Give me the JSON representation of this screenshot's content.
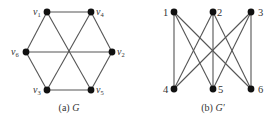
{
  "figure": {
    "graph_a": {
      "caption_prefix": "(a) ",
      "caption_name": "G",
      "nodes": [
        {
          "id": "v1",
          "letter": "v",
          "sub": "1",
          "x": 47,
          "y": 12,
          "lx": 33,
          "ly": 15
        },
        {
          "id": "v4",
          "letter": "v",
          "sub": "4",
          "x": 91,
          "y": 12,
          "lx": 96,
          "ly": 15
        },
        {
          "id": "v6",
          "letter": "v",
          "sub": "6",
          "x": 26,
          "y": 52,
          "lx": 11,
          "ly": 55
        },
        {
          "id": "v2",
          "letter": "v",
          "sub": "2",
          "x": 112,
          "y": 52,
          "lx": 117,
          "ly": 55
        },
        {
          "id": "v3",
          "letter": "v",
          "sub": "3",
          "x": 47,
          "y": 90,
          "lx": 33,
          "ly": 93
        },
        {
          "id": "v5",
          "letter": "v",
          "sub": "5",
          "x": 91,
          "y": 90,
          "lx": 96,
          "ly": 93
        }
      ],
      "edges": [
        [
          "v1",
          "v4"
        ],
        [
          "v1",
          "v6"
        ],
        [
          "v1",
          "v5"
        ],
        [
          "v4",
          "v2"
        ],
        [
          "v4",
          "v3"
        ],
        [
          "v6",
          "v2"
        ],
        [
          "v6",
          "v3"
        ],
        [
          "v2",
          "v5"
        ],
        [
          "v3",
          "v5"
        ]
      ]
    },
    "graph_b": {
      "caption_prefix": "(b) ",
      "caption_name": "G′",
      "nodes": [
        {
          "id": "1",
          "label": "1",
          "x": 174,
          "y": 12,
          "lx": 163,
          "ly": 16
        },
        {
          "id": "2",
          "label": "2",
          "x": 213,
          "y": 12,
          "lx": 217,
          "ly": 16
        },
        {
          "id": "3",
          "label": "3",
          "x": 251,
          "y": 12,
          "lx": 258,
          "ly": 16
        },
        {
          "id": "4",
          "label": "4",
          "x": 174,
          "y": 89,
          "lx": 163,
          "ly": 93
        },
        {
          "id": "5",
          "label": "5",
          "x": 213,
          "y": 89,
          "lx": 218,
          "ly": 93
        },
        {
          "id": "6",
          "label": "6",
          "x": 251,
          "y": 89,
          "lx": 258,
          "ly": 93
        }
      ],
      "edges": [
        [
          "1",
          "4"
        ],
        [
          "1",
          "5"
        ],
        [
          "1",
          "6"
        ],
        [
          "2",
          "4"
        ],
        [
          "2",
          "5"
        ],
        [
          "2",
          "6"
        ],
        [
          "3",
          "4"
        ],
        [
          "3",
          "5"
        ],
        [
          "3",
          "6"
        ]
      ]
    }
  }
}
